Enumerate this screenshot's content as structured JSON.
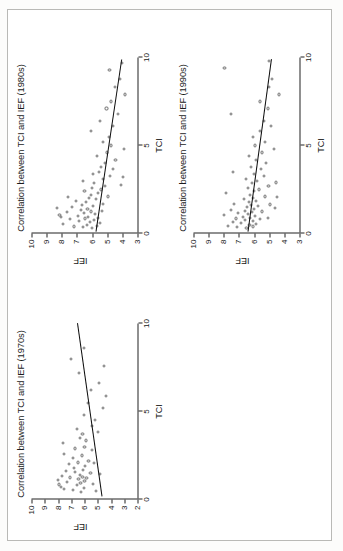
{
  "document": {
    "type": "scanned-figure-page",
    "orientation": "rotated-90-ccw",
    "page_border_color": "#b9b9b6",
    "background_color": "#ffffff"
  },
  "chart_data": [
    {
      "id": "1970s",
      "type": "scatter",
      "title": "Correlation between TCI and IEF (1970s)",
      "xlabel": "TCI",
      "ylabel": "IEF",
      "xlim": [
        0,
        10
      ],
      "ylim": [
        2,
        10
      ],
      "xticks": [
        0,
        5,
        10
      ],
      "yticks": [
        10,
        9,
        8,
        7,
        6,
        5,
        4,
        3,
        2
      ],
      "xtick_labels": [
        "0",
        "5",
        "10"
      ],
      "ytick_labels": [
        "10",
        "9",
        "8",
        "7",
        "6",
        "5",
        "4",
        "3",
        "2"
      ],
      "grid": false,
      "legend": "none",
      "marker": "open-circle",
      "marker_color": "#6f6f6f",
      "fit_line": {
        "color": "#0c0c0c",
        "x0": 0.15,
        "y0": 4.7,
        "x1": 10.0,
        "y1": 6.55
      },
      "points": [
        [
          0.45,
          6.25
        ],
        [
          0.55,
          6.9
        ],
        [
          0.6,
          7.55
        ],
        [
          0.65,
          6.05
        ],
        [
          0.7,
          7.8
        ],
        [
          0.8,
          6.6
        ],
        [
          0.85,
          7.95
        ],
        [
          0.9,
          5.35
        ],
        [
          0.95,
          6.3
        ],
        [
          1.0,
          7.3
        ],
        [
          1.05,
          6.0
        ],
        [
          1.1,
          8.0
        ],
        [
          1.15,
          6.45
        ],
        [
          1.2,
          5.85
        ],
        [
          1.25,
          7.1
        ],
        [
          1.3,
          6.15
        ],
        [
          1.35,
          7.7
        ],
        [
          1.4,
          6.35
        ],
        [
          1.5,
          5.55
        ],
        [
          1.55,
          6.7
        ],
        [
          1.6,
          7.4
        ],
        [
          1.7,
          6.1
        ],
        [
          1.8,
          6.8
        ],
        [
          1.9,
          5.95
        ],
        [
          2.0,
          7.2
        ],
        [
          2.1,
          6.5
        ],
        [
          2.2,
          5.7
        ],
        [
          2.35,
          6.9
        ],
        [
          2.5,
          6.2
        ],
        [
          2.6,
          7.55
        ],
        [
          2.8,
          5.4
        ],
        [
          2.9,
          6.75
        ],
        [
          3.0,
          6.0
        ],
        [
          3.2,
          7.6
        ],
        [
          3.35,
          5.9
        ],
        [
          3.5,
          6.35
        ],
        [
          3.7,
          6.15
        ],
        [
          3.85,
          5.0
        ],
        [
          4.0,
          6.6
        ],
        [
          4.2,
          5.45
        ],
        [
          4.5,
          5.2
        ],
        [
          4.8,
          6.05
        ],
        [
          5.2,
          4.6
        ],
        [
          5.5,
          5.75
        ],
        [
          5.9,
          4.35
        ],
        [
          6.2,
          5.5
        ],
        [
          6.6,
          4.9
        ],
        [
          7.2,
          6.4
        ],
        [
          7.6,
          4.55
        ],
        [
          8.0,
          7.0
        ],
        [
          8.6,
          6.05
        ],
        [
          1.45,
          4.8
        ],
        [
          0.5,
          5.15
        ],
        [
          2.05,
          5.3
        ]
      ]
    },
    {
      "id": "1980s",
      "type": "scatter",
      "title": "Correlation between TCI and IEF (1980s)",
      "xlabel": "TCI",
      "ylabel": "IEF",
      "xlim": [
        0,
        10
      ],
      "ylim": [
        3,
        10
      ],
      "xticks": [
        0,
        5,
        10
      ],
      "yticks": [
        10,
        9,
        8,
        7,
        6,
        5,
        4,
        3
      ],
      "xtick_labels": [
        "0",
        "5",
        "10"
      ],
      "ytick_labels": [
        "10",
        "9",
        "8",
        "7",
        "6",
        "5",
        "4",
        "3"
      ],
      "grid": false,
      "legend": "none",
      "marker": "open-circle",
      "marker_color": "#6f6f6f",
      "fit_line": {
        "color": "#0c0c0c",
        "x0": 0.1,
        "y0": 5.75,
        "x1": 9.9,
        "y1": 4.05
      },
      "points": [
        [
          0.3,
          6.0
        ],
        [
          0.35,
          6.6
        ],
        [
          0.4,
          7.2
        ],
        [
          0.45,
          5.7
        ],
        [
          0.5,
          6.35
        ],
        [
          0.55,
          7.9
        ],
        [
          0.6,
          5.45
        ],
        [
          0.65,
          6.15
        ],
        [
          0.7,
          6.85
        ],
        [
          0.75,
          5.9
        ],
        [
          0.8,
          7.45
        ],
        [
          0.85,
          6.45
        ],
        [
          0.9,
          5.6
        ],
        [
          0.95,
          6.25
        ],
        [
          1.0,
          6.95
        ],
        [
          1.05,
          8.15
        ],
        [
          1.1,
          5.8
        ],
        [
          1.15,
          6.55
        ],
        [
          1.2,
          7.65
        ],
        [
          1.25,
          6.05
        ],
        [
          1.3,
          5.35
        ],
        [
          1.35,
          6.75
        ],
        [
          1.4,
          6.3
        ],
        [
          1.5,
          7.3
        ],
        [
          1.55,
          5.95
        ],
        [
          1.6,
          6.65
        ],
        [
          1.7,
          5.25
        ],
        [
          1.8,
          6.4
        ],
        [
          1.85,
          7.05
        ],
        [
          1.95,
          5.75
        ],
        [
          2.0,
          6.2
        ],
        [
          2.1,
          4.95
        ],
        [
          2.2,
          6.05
        ],
        [
          2.3,
          5.6
        ],
        [
          2.4,
          6.5
        ],
        [
          2.5,
          5.4
        ],
        [
          2.6,
          6.0
        ],
        [
          2.7,
          5.15
        ],
        [
          2.85,
          5.85
        ],
        [
          3.0,
          6.6
        ],
        [
          3.1,
          5.3
        ],
        [
          3.25,
          4.8
        ],
        [
          3.4,
          5.95
        ],
        [
          3.5,
          5.55
        ],
        [
          3.65,
          4.6
        ],
        [
          3.8,
          5.4
        ],
        [
          4.0,
          5.15
        ],
        [
          4.2,
          4.45
        ],
        [
          4.4,
          5.65
        ],
        [
          4.6,
          5.0
        ],
        [
          4.8,
          3.9
        ],
        [
          5.0,
          4.75
        ],
        [
          5.2,
          5.3
        ],
        [
          5.5,
          4.9
        ],
        [
          5.8,
          6.1
        ],
        [
          6.1,
          4.6
        ],
        [
          6.4,
          5.5
        ],
        [
          6.8,
          4.3
        ],
        [
          7.1,
          5.05
        ],
        [
          7.5,
          4.75
        ],
        [
          7.9,
          3.8
        ],
        [
          8.3,
          4.5
        ],
        [
          8.8,
          4.15
        ],
        [
          9.3,
          4.85
        ],
        [
          9.7,
          4.0
        ],
        [
          2.05,
          7.6
        ],
        [
          1.45,
          8.3
        ],
        [
          0.95,
          8.05
        ],
        [
          2.75,
          4.1
        ],
        [
          3.2,
          3.95
        ]
      ]
    },
    {
      "id": "1990s",
      "type": "scatter",
      "title": "Correlation between TCI and IEF (1990s)",
      "xlabel": "TCI",
      "ylabel": "IEF",
      "xlim": [
        0,
        10
      ],
      "ylim": [
        3,
        10
      ],
      "xticks": [
        0,
        5,
        10
      ],
      "yticks": [
        10,
        9,
        8,
        7,
        6,
        5,
        4,
        3
      ],
      "xtick_labels": [
        "0",
        "5",
        "10"
      ],
      "ytick_labels": [
        "10",
        "9",
        "8",
        "7",
        "6",
        "5",
        "4",
        "3"
      ],
      "grid": false,
      "legend": "none",
      "marker": "open-circle",
      "marker_color": "#6f6f6f",
      "fit_line": {
        "color": "#0c0c0c",
        "x0": 0.1,
        "y0": 6.45,
        "x1": 9.9,
        "y1": 4.9
      },
      "points": [
        [
          0.3,
          6.5
        ],
        [
          0.35,
          7.1
        ],
        [
          0.4,
          6.1
        ],
        [
          0.45,
          7.7
        ],
        [
          0.5,
          6.3
        ],
        [
          0.55,
          5.85
        ],
        [
          0.6,
          6.85
        ],
        [
          0.65,
          7.4
        ],
        [
          0.7,
          6.05
        ],
        [
          0.75,
          6.6
        ],
        [
          0.8,
          5.6
        ],
        [
          0.85,
          7.2
        ],
        [
          0.9,
          6.25
        ],
        [
          0.95,
          6.75
        ],
        [
          1.0,
          5.95
        ],
        [
          1.05,
          8.0
        ],
        [
          1.1,
          6.4
        ],
        [
          1.15,
          7.05
        ],
        [
          1.2,
          6.15
        ],
        [
          1.25,
          5.5
        ],
        [
          1.3,
          6.6
        ],
        [
          1.35,
          7.55
        ],
        [
          1.4,
          6.0
        ],
        [
          1.5,
          6.45
        ],
        [
          1.55,
          5.75
        ],
        [
          1.6,
          6.2
        ],
        [
          1.7,
          7.3
        ],
        [
          1.8,
          6.35
        ],
        [
          1.85,
          5.9
        ],
        [
          1.95,
          6.65
        ],
        [
          2.0,
          6.05
        ],
        [
          2.1,
          5.3
        ],
        [
          2.2,
          6.25
        ],
        [
          2.3,
          7.85
        ],
        [
          2.4,
          6.0
        ],
        [
          2.5,
          5.65
        ],
        [
          2.6,
          6.4
        ],
        [
          2.7,
          5.05
        ],
        [
          2.85,
          6.15
        ],
        [
          3.0,
          5.8
        ],
        [
          3.1,
          6.55
        ],
        [
          3.25,
          5.35
        ],
        [
          3.4,
          6.0
        ],
        [
          3.5,
          7.4
        ],
        [
          3.65,
          5.55
        ],
        [
          3.8,
          6.2
        ],
        [
          4.0,
          5.2
        ],
        [
          4.2,
          5.85
        ],
        [
          4.4,
          6.35
        ],
        [
          4.6,
          5.45
        ],
        [
          4.8,
          4.7
        ],
        [
          5.0,
          5.95
        ],
        [
          5.2,
          5.25
        ],
        [
          5.5,
          6.1
        ],
        [
          5.8,
          5.6
        ],
        [
          6.1,
          4.9
        ],
        [
          6.4,
          5.35
        ],
        [
          6.8,
          7.5
        ],
        [
          7.1,
          5.1
        ],
        [
          7.5,
          5.6
        ],
        [
          7.9,
          4.35
        ],
        [
          8.3,
          5.0
        ],
        [
          8.8,
          4.8
        ],
        [
          9.4,
          7.95
        ],
        [
          9.8,
          5.0
        ],
        [
          1.45,
          4.6
        ],
        [
          2.05,
          4.5
        ],
        [
          2.9,
          4.55
        ],
        [
          0.9,
          5.1
        ],
        [
          1.65,
          4.95
        ]
      ]
    }
  ]
}
